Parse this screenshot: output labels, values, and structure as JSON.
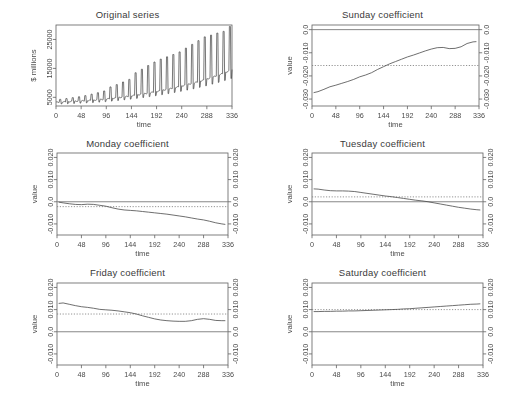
{
  "figure": {
    "layout": "2 columns x 3 rows",
    "background": "#ffffff",
    "line_color": "#3c3c3c",
    "axis_color": "#555555",
    "grid": false,
    "xticks": [
      0,
      48,
      96,
      144,
      192,
      240,
      288,
      336
    ],
    "xlabel": "time",
    "ylabel": "value"
  },
  "panels": [
    {
      "id": "original-series",
      "title": "Original series",
      "ylabel": "$ millions",
      "xlabel": "time",
      "yticks": [
        "5000",
        "15000",
        "25000"
      ],
      "right_axis": false
    },
    {
      "id": "sunday-coefficient",
      "title": "Sunday coefficient",
      "ylabel": "value",
      "xlabel": "time",
      "yticks": [
        "0.0",
        "-0.010",
        "-0.020",
        "-0.030"
      ],
      "right_axis": true
    },
    {
      "id": "monday-coefficient",
      "title": "Monday coefficient",
      "ylabel": "value",
      "xlabel": "time",
      "yticks": [
        "0.020",
        "0.010",
        "0.0",
        "-0.010"
      ],
      "right_axis": true
    },
    {
      "id": "tuesday-coefficient",
      "title": "Tuesday coefficient",
      "ylabel": "value",
      "xlabel": "time",
      "yticks": [
        "0.020",
        "0.010",
        "0.0",
        "-0.010"
      ],
      "right_axis": true
    },
    {
      "id": "friday-coefficient",
      "title": "Friday coefficient",
      "ylabel": "value",
      "xlabel": "time",
      "yticks": [
        "0.020",
        "0.010",
        "0.0",
        "-0.010"
      ],
      "right_axis": true
    },
    {
      "id": "saturday-coefficient",
      "title": "Saturday coefficient",
      "ylabel": "value",
      "xlabel": "time",
      "yticks": [
        "0.020",
        "0.010",
        "0.0",
        "-0.010"
      ],
      "right_axis": true
    }
  ],
  "chart_data": [
    {
      "type": "line",
      "id": "original-series",
      "title": "Original series",
      "xlabel": "time",
      "ylabel": "$ millions",
      "xlim": [
        0,
        336
      ],
      "ylim": [
        2000,
        30000
      ],
      "xticks": [
        0,
        48,
        96,
        144,
        192,
        240,
        288,
        336
      ],
      "yticks": [
        5000,
        15000,
        25000
      ],
      "grid": false,
      "description": "Monthly retail-style series with sharp regular end-of-year spikes growing in amplitude over a rising trend",
      "baseline": {
        "x": [
          0,
          24,
          48,
          72,
          96,
          120,
          144,
          168,
          192,
          216,
          240,
          264,
          288,
          312,
          336
        ],
        "y": [
          3300,
          3500,
          3750,
          4000,
          4400,
          4900,
          5500,
          6200,
          7000,
          7900,
          8900,
          10000,
          11300,
          12800,
          14500
        ]
      },
      "spikes": {
        "x": [
          8,
          20,
          32,
          44,
          56,
          68,
          80,
          92,
          104,
          116,
          128,
          140,
          152,
          164,
          176,
          188,
          200,
          212,
          224,
          236,
          248,
          260,
          272,
          284,
          296,
          308,
          320,
          332
        ],
        "y": [
          4300,
          4600,
          4900,
          5200,
          5600,
          6100,
          6600,
          7200,
          8600,
          9400,
          10300,
          11200,
          13500,
          14700,
          16000,
          17200,
          18200,
          19000,
          19800,
          20700,
          22000,
          23300,
          24600,
          25900,
          26500,
          27200,
          27800,
          29500
        ]
      }
    },
    {
      "type": "line",
      "id": "sunday-coefficient",
      "title": "Sunday coefficient",
      "xlabel": "time",
      "ylabel": "value",
      "xlim": [
        0,
        336
      ],
      "ylim": [
        -0.033,
        0.002
      ],
      "xticks": [
        0,
        48,
        96,
        144,
        192,
        240,
        288,
        336
      ],
      "yticks": [
        0.0,
        -0.01,
        -0.02,
        -0.03
      ],
      "grid": false,
      "reference_line_solid": 0.0,
      "reference_line_dotted": -0.0155,
      "x": [
        4,
        12,
        24,
        36,
        48,
        60,
        72,
        84,
        96,
        108,
        120,
        132,
        144,
        156,
        168,
        180,
        192,
        204,
        216,
        228,
        240,
        252,
        264,
        276,
        288,
        300,
        312,
        324,
        330
      ],
      "y": [
        -0.0272,
        -0.0268,
        -0.0258,
        -0.0247,
        -0.024,
        -0.0232,
        -0.0224,
        -0.0215,
        -0.0204,
        -0.0196,
        -0.0186,
        -0.0172,
        -0.016,
        -0.0148,
        -0.0138,
        -0.0128,
        -0.0118,
        -0.011,
        -0.0101,
        -0.0092,
        -0.0084,
        -0.0078,
        -0.0077,
        -0.0082,
        -0.0081,
        -0.0074,
        -0.006,
        -0.0053,
        -0.0052
      ]
    },
    {
      "type": "line",
      "id": "monday-coefficient",
      "title": "Monday coefficient",
      "xlabel": "time",
      "ylabel": "value",
      "xlim": [
        0,
        336
      ],
      "ylim": [
        -0.015,
        0.022
      ],
      "xticks": [
        0,
        48,
        96,
        144,
        192,
        240,
        288,
        336
      ],
      "yticks": [
        0.02,
        0.01,
        0.0,
        -0.01
      ],
      "grid": false,
      "reference_line_solid": 0.0,
      "reference_line_dotted": -0.0022,
      "x": [
        4,
        12,
        24,
        36,
        48,
        60,
        72,
        84,
        96,
        108,
        120,
        132,
        144,
        156,
        168,
        180,
        192,
        204,
        216,
        228,
        240,
        252,
        264,
        276,
        288,
        300,
        312,
        324,
        330
      ],
      "y": [
        -0.0002,
        -0.0005,
        -0.0009,
        -0.0012,
        -0.0013,
        -0.0011,
        -0.0012,
        -0.0016,
        -0.002,
        -0.0027,
        -0.0033,
        -0.0037,
        -0.0039,
        -0.0041,
        -0.0044,
        -0.0047,
        -0.005,
        -0.0053,
        -0.0056,
        -0.006,
        -0.0064,
        -0.0068,
        -0.0073,
        -0.0078,
        -0.0082,
        -0.0088,
        -0.0095,
        -0.01,
        -0.0102
      ]
    },
    {
      "type": "line",
      "id": "tuesday-coefficient",
      "title": "Tuesday coefficient",
      "xlabel": "time",
      "ylabel": "value",
      "xlim": [
        0,
        336
      ],
      "ylim": [
        -0.015,
        0.022
      ],
      "xticks": [
        0,
        48,
        96,
        144,
        192,
        240,
        288,
        336
      ],
      "yticks": [
        0.02,
        0.01,
        0.0,
        -0.01
      ],
      "grid": false,
      "reference_line_solid": 0.0,
      "reference_line_dotted": 0.0022,
      "x": [
        4,
        12,
        24,
        36,
        48,
        60,
        72,
        84,
        96,
        108,
        120,
        132,
        144,
        156,
        168,
        180,
        192,
        204,
        216,
        228,
        240,
        252,
        264,
        276,
        288,
        300,
        312,
        324,
        330
      ],
      "y": [
        0.0058,
        0.0057,
        0.0053,
        0.005,
        0.0049,
        0.0049,
        0.0048,
        0.0046,
        0.0042,
        0.0038,
        0.0034,
        0.003,
        0.0026,
        0.0023,
        0.0019,
        0.0015,
        0.0011,
        0.0007,
        0.0004,
        0.0,
        -0.0005,
        -0.001,
        -0.0015,
        -0.002,
        -0.0025,
        -0.0029,
        -0.0033,
        -0.0036,
        -0.0037
      ]
    },
    {
      "type": "line",
      "id": "friday-coefficient",
      "title": "Friday coefficient",
      "xlabel": "time",
      "ylabel": "value",
      "xlim": [
        0,
        336
      ],
      "ylim": [
        -0.015,
        0.022
      ],
      "xticks": [
        0,
        48,
        96,
        144,
        192,
        240,
        288,
        336
      ],
      "yticks": [
        0.02,
        0.01,
        0.0,
        -0.01
      ],
      "grid": false,
      "reference_line_solid": 0.0,
      "reference_line_dotted": 0.008,
      "x": [
        4,
        12,
        24,
        36,
        48,
        60,
        72,
        84,
        96,
        108,
        120,
        132,
        144,
        156,
        168,
        180,
        192,
        204,
        216,
        228,
        240,
        252,
        264,
        276,
        288,
        300,
        312,
        324,
        330
      ],
      "y": [
        0.0128,
        0.013,
        0.0124,
        0.0118,
        0.0113,
        0.011,
        0.0106,
        0.0101,
        0.0099,
        0.0097,
        0.0094,
        0.009,
        0.0086,
        0.008,
        0.0072,
        0.0065,
        0.0058,
        0.0053,
        0.005,
        0.0048,
        0.0047,
        0.0047,
        0.005,
        0.0056,
        0.0059,
        0.0056,
        0.0051,
        0.005,
        0.005
      ]
    },
    {
      "type": "line",
      "id": "saturday-coefficient",
      "title": "Saturday coefficient",
      "xlabel": "time",
      "ylabel": "value",
      "xlim": [
        0,
        336
      ],
      "ylim": [
        -0.015,
        0.022
      ],
      "xticks": [
        0,
        48,
        96,
        144,
        192,
        240,
        288,
        336
      ],
      "yticks": [
        0.02,
        0.01,
        0.0,
        -0.01
      ],
      "grid": false,
      "reference_line_solid": 0.0,
      "reference_line_dotted": 0.01,
      "x": [
        4,
        12,
        24,
        36,
        48,
        60,
        72,
        84,
        96,
        108,
        120,
        132,
        144,
        156,
        168,
        180,
        192,
        204,
        216,
        228,
        240,
        252,
        264,
        276,
        288,
        300,
        312,
        324,
        330
      ],
      "y": [
        0.0091,
        0.0091,
        0.0092,
        0.0092,
        0.0093,
        0.0093,
        0.0094,
        0.0094,
        0.0095,
        0.0096,
        0.0097,
        0.0098,
        0.0099,
        0.01,
        0.0101,
        0.0103,
        0.0104,
        0.0106,
        0.0108,
        0.011,
        0.0112,
        0.0114,
        0.0116,
        0.0118,
        0.012,
        0.0122,
        0.0124,
        0.0125,
        0.0126
      ]
    }
  ]
}
